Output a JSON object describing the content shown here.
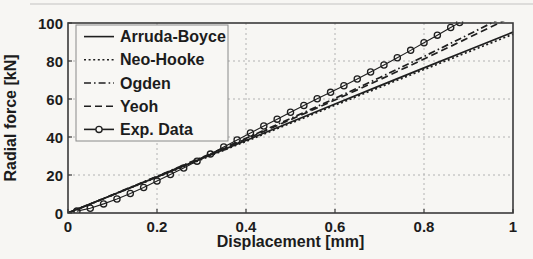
{
  "figure_title": "Radial force vs displacement comparison of hyperelastic models with experimental data",
  "colors": {
    "ink": "#1f1f1f",
    "grid": "#b2b2b2",
    "frame": "#3a3a3a",
    "background": "#f7f6f3",
    "legend_bg": "#f8f7f4"
  },
  "chart_data": {
    "type": "line",
    "title": "",
    "xlabel": "Displacement [mm]",
    "ylabel": "Radial force [kN]",
    "xlim": [
      0,
      1
    ],
    "ylim": [
      0,
      100
    ],
    "grid": true,
    "legend_position": "top-left",
    "xticks": [
      "0",
      "0.2",
      "0.4",
      "0.6",
      "0.8",
      "1"
    ],
    "xtick_values": [
      0,
      0.2,
      0.4,
      0.6,
      0.8,
      1
    ],
    "yticks": [
      "0",
      "20",
      "40",
      "60",
      "80",
      "100"
    ],
    "ytick_values": [
      0,
      20,
      40,
      60,
      80,
      100
    ],
    "series": [
      {
        "name": "Arruda-Boyce",
        "style": "solid",
        "marker": "none",
        "x": [
          0,
          0.1,
          0.2,
          0.3,
          0.4,
          0.5,
          0.6,
          0.7,
          0.8,
          0.9,
          1.0
        ],
        "y": [
          0,
          9.5,
          19.0,
          28.6,
          38.2,
          47.8,
          57.4,
          66.9,
          76.4,
          85.8,
          95.2
        ]
      },
      {
        "name": "Neo-Hooke",
        "style": "dotted",
        "marker": "none",
        "x": [
          0,
          0.1,
          0.2,
          0.3,
          0.4,
          0.5,
          0.6,
          0.7,
          0.8,
          0.9,
          1.0
        ],
        "y": [
          0,
          9.4,
          18.8,
          28.2,
          37.7,
          47.2,
          56.7,
          66.1,
          75.5,
          84.8,
          94.1
        ]
      },
      {
        "name": "Ogden",
        "style": "dashdot",
        "marker": "none",
        "x": [
          0,
          0.1,
          0.2,
          0.3,
          0.4,
          0.5,
          0.6,
          0.7,
          0.8,
          0.9,
          1.0
        ],
        "y": [
          0,
          9.6,
          19.3,
          29.2,
          39.3,
          49.7,
          60.3,
          71.2,
          82.4,
          93.9,
          105.7
        ]
      },
      {
        "name": "Yeoh",
        "style": "dashed",
        "marker": "none",
        "x": [
          0,
          0.1,
          0.2,
          0.3,
          0.4,
          0.5,
          0.6,
          0.7,
          0.8,
          0.9,
          1.0
        ],
        "y": [
          0,
          9.5,
          19.1,
          28.9,
          38.9,
          49.1,
          59.5,
          70.1,
          81.0,
          92.2,
          103.6
        ]
      },
      {
        "name": "Exp. Data",
        "style": "solid",
        "marker": "circle",
        "x": [
          0.02,
          0.05,
          0.08,
          0.11,
          0.14,
          0.17,
          0.2,
          0.23,
          0.26,
          0.29,
          0.32,
          0.35,
          0.38,
          0.41,
          0.44,
          0.47,
          0.5,
          0.53,
          0.56,
          0.59,
          0.62,
          0.65,
          0.68,
          0.71,
          0.74,
          0.77,
          0.8,
          0.83,
          0.86,
          0.88
        ],
        "y": [
          1.0,
          2.5,
          4.8,
          7.4,
          10.3,
          13.4,
          16.8,
          20.2,
          23.7,
          27.3,
          31.0,
          34.7,
          38.4,
          42.1,
          45.8,
          49.4,
          53.0,
          56.6,
          60.1,
          63.5,
          67.0,
          70.5,
          74.2,
          77.9,
          81.7,
          85.6,
          89.6,
          93.6,
          97.6,
          100.2
        ]
      }
    ]
  }
}
